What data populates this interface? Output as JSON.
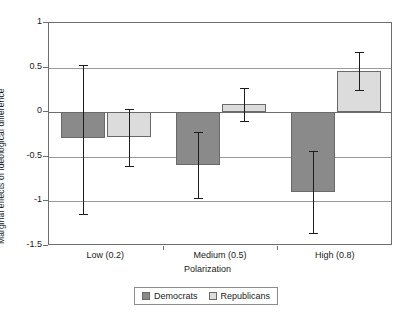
{
  "chart_data": {
    "type": "bar",
    "title": "",
    "xlabel": "Polarization",
    "ylabel": "Marginal effects of ideological difference",
    "categories": [
      "Low (0.2)",
      "Medium (0.5)",
      "High (0.8)"
    ],
    "ylim": [
      -1.5,
      1
    ],
    "yticks": [
      "1",
      "0.5",
      "0",
      "-0.5",
      "-1",
      "-1.5"
    ],
    "ytick_values": [
      1,
      0.5,
      0,
      -0.5,
      -1,
      -1.5
    ],
    "grid": true,
    "legend_position": "bottom",
    "errorbars": true,
    "series": [
      {
        "name": "Democrats",
        "color": "#8a8a8a",
        "values": [
          -0.29,
          -0.59,
          -0.89
        ],
        "err_low": [
          -1.14,
          -0.96,
          -1.35
        ],
        "err_high": [
          0.53,
          -0.22,
          -0.43
        ]
      },
      {
        "name": "Republicans",
        "color": "#dcdcdc",
        "values": [
          -0.28,
          0.09,
          0.46
        ],
        "err_low": [
          -0.6,
          -0.1,
          0.25
        ],
        "err_high": [
          0.04,
          0.27,
          0.68
        ]
      }
    ]
  },
  "legend": {
    "items": [
      {
        "label": "Democrats",
        "swatch": "dem"
      },
      {
        "label": "Republicans",
        "swatch": "rep"
      }
    ]
  },
  "axes": {
    "y_title": "Marginal effects of ideological difference",
    "x_title": "Polarization"
  }
}
